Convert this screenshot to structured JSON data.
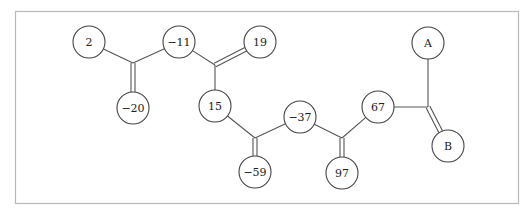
{
  "diagram": {
    "type": "tree-molecule-like",
    "nodes": [
      {
        "id": "n2",
        "label": "2",
        "x": 89,
        "y": 42
      },
      {
        "id": "n-11",
        "label": "−11",
        "x": 179,
        "y": 42
      },
      {
        "id": "n19",
        "label": "19",
        "x": 260,
        "y": 42
      },
      {
        "id": "n-20",
        "label": "−20",
        "x": 133,
        "y": 108
      },
      {
        "id": "n15",
        "label": "15",
        "x": 215,
        "y": 106
      },
      {
        "id": "n-37",
        "label": "−37",
        "x": 300,
        "y": 117
      },
      {
        "id": "n-59",
        "label": "−59",
        "x": 255,
        "y": 172
      },
      {
        "id": "n97",
        "label": "97",
        "x": 342,
        "y": 173
      },
      {
        "id": "n67",
        "label": "67",
        "x": 378,
        "y": 107
      },
      {
        "id": "nA",
        "label": "A",
        "x": 428,
        "y": 43
      },
      {
        "id": "nB",
        "label": "B",
        "x": 448,
        "y": 146
      }
    ],
    "junctions": [
      {
        "id": "j1",
        "x": 133,
        "y": 63
      },
      {
        "id": "j2",
        "x": 215,
        "y": 65
      },
      {
        "id": "j3",
        "x": 255,
        "y": 138
      },
      {
        "id": "j4",
        "x": 342,
        "y": 138
      },
      {
        "id": "j5",
        "x": 428,
        "y": 107
      }
    ],
    "edges": [
      {
        "from": "n2",
        "to": "j1",
        "double": false
      },
      {
        "from": "n-11",
        "to": "j1",
        "double": false
      },
      {
        "from": "j1",
        "to": "n-20",
        "double": true
      },
      {
        "from": "n-11",
        "to": "j2",
        "double": false
      },
      {
        "from": "j2",
        "to": "n19",
        "double": true
      },
      {
        "from": "j2",
        "to": "n15",
        "double": false
      },
      {
        "from": "n15",
        "to": "j3",
        "double": false
      },
      {
        "from": "n-37",
        "to": "j3",
        "double": false
      },
      {
        "from": "j3",
        "to": "n-59",
        "double": true
      },
      {
        "from": "n-37",
        "to": "j4",
        "double": false
      },
      {
        "from": "j4",
        "to": "n97",
        "double": true
      },
      {
        "from": "n67",
        "to": "j4",
        "double": false
      },
      {
        "from": "n67",
        "to": "j5",
        "double": false
      },
      {
        "from": "nA",
        "to": "j5",
        "double": false
      },
      {
        "from": "j5",
        "to": "nB",
        "double": true
      }
    ],
    "node_radius": 16
  }
}
